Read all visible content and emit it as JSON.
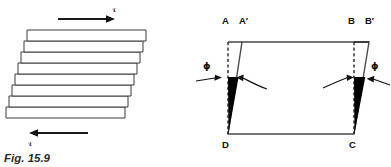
{
  "figure": {
    "caption": "Fig. 15.9",
    "background_color": "#ffffff",
    "ink_color": "#1a1a1a",
    "wedge_color": "#000000",
    "width": 391,
    "height": 167
  },
  "left_diagram": {
    "name": "sheared-plate-stack",
    "plate_count": 8,
    "top_force_label": "τ",
    "bottom_force_label": "τ",
    "top_arrow_direction": "right",
    "bottom_arrow_direction": "left",
    "plates": [
      {
        "index": 1,
        "x": 27,
        "y": 30,
        "width": 119,
        "height": 11
      },
      {
        "index": 2,
        "x": 24,
        "y": 41,
        "width": 119,
        "height": 11
      },
      {
        "index": 3,
        "x": 21,
        "y": 52,
        "width": 119,
        "height": 11
      },
      {
        "index": 4,
        "x": 18,
        "y": 63,
        "width": 119,
        "height": 11
      },
      {
        "index": 5,
        "x": 15,
        "y": 74,
        "width": 119,
        "height": 11
      },
      {
        "index": 6,
        "x": 12,
        "y": 85,
        "width": 119,
        "height": 11
      },
      {
        "index": 7,
        "x": 9,
        "y": 96,
        "width": 119,
        "height": 11
      },
      {
        "index": 8,
        "x": 6,
        "y": 107,
        "width": 119,
        "height": 11
      }
    ]
  },
  "right_diagram": {
    "name": "shear-strain-parallelogram",
    "vertex_labels": {
      "top_left_original": "A",
      "top_left_displaced": "A′",
      "top_right_original": "B",
      "top_right_displaced": "B′",
      "bottom_left": "D",
      "bottom_right": "C"
    },
    "angle_label_left": "ϕ",
    "angle_label_right": "ϕ",
    "geometry": {
      "A": [
        228,
        42
      ],
      "Aprime": [
        242,
        42
      ],
      "B": [
        354,
        42
      ],
      "Bprime": [
        369,
        42
      ],
      "D": [
        228,
        134
      ],
      "C": [
        354,
        134
      ]
    }
  }
}
